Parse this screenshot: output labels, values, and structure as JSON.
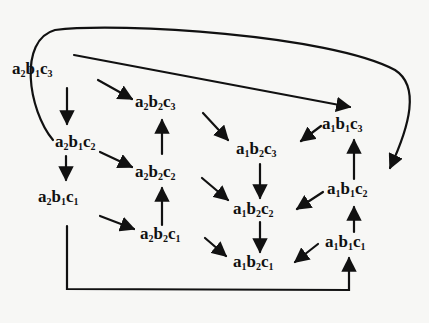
{
  "diagram": {
    "type": "directed-graph",
    "colors": {
      "background": "#f7f7f5",
      "ink": "#111111"
    },
    "nodes": [
      {
        "id": "a2b1c3",
        "parts": [
          [
            "a",
            "2"
          ],
          [
            "b",
            "1"
          ],
          [
            "c",
            "3"
          ]
        ],
        "x": 12,
        "y": 60
      },
      {
        "id": "a2b2c3",
        "parts": [
          [
            "a",
            "2"
          ],
          [
            "b",
            "2"
          ],
          [
            "c",
            "3"
          ]
        ],
        "x": 135,
        "y": 93
      },
      {
        "id": "a2b1c2",
        "parts": [
          [
            "a",
            "2"
          ],
          [
            "b",
            "1"
          ],
          [
            "c",
            "2"
          ]
        ],
        "x": 55,
        "y": 133
      },
      {
        "id": "a2b2c2",
        "parts": [
          [
            "a",
            "2"
          ],
          [
            "b",
            "2"
          ],
          [
            "c",
            "2"
          ]
        ],
        "x": 135,
        "y": 163
      },
      {
        "id": "a2b1c1",
        "parts": [
          [
            "a",
            "2"
          ],
          [
            "b",
            "1"
          ],
          [
            "c",
            "1"
          ]
        ],
        "x": 38,
        "y": 188
      },
      {
        "id": "a2b2c1",
        "parts": [
          [
            "a",
            "2"
          ],
          [
            "b",
            "2"
          ],
          [
            "c",
            "1"
          ]
        ],
        "x": 140,
        "y": 225
      },
      {
        "id": "a1b2c3",
        "parts": [
          [
            "a",
            "1"
          ],
          [
            "b",
            "2"
          ],
          [
            "c",
            "3"
          ]
        ],
        "x": 236,
        "y": 140
      },
      {
        "id": "a1b1c3",
        "parts": [
          [
            "a",
            "1"
          ],
          [
            "b",
            "1"
          ],
          [
            "c",
            "3"
          ]
        ],
        "x": 322,
        "y": 115
      },
      {
        "id": "a1b2c2",
        "parts": [
          [
            "a",
            "1"
          ],
          [
            "b",
            "2"
          ],
          [
            "c",
            "2"
          ]
        ],
        "x": 233,
        "y": 200
      },
      {
        "id": "a1b1c2",
        "parts": [
          [
            "a",
            "1"
          ],
          [
            "b",
            "1"
          ],
          [
            "c",
            "2"
          ]
        ],
        "x": 327,
        "y": 180
      },
      {
        "id": "a1b2c1",
        "parts": [
          [
            "a",
            "1"
          ],
          [
            "b",
            "2"
          ],
          [
            "c",
            "1"
          ]
        ],
        "x": 233,
        "y": 253
      },
      {
        "id": "a1b1c1",
        "parts": [
          [
            "a",
            "1"
          ],
          [
            "b",
            "1"
          ],
          [
            "c",
            "1"
          ]
        ],
        "x": 325,
        "y": 233
      }
    ],
    "edges": [
      {
        "from": "a2b1c3",
        "to": "a2b1c2"
      },
      {
        "from": "a2b1c3",
        "to": "a2b2c3"
      },
      {
        "from": "a2b1c3",
        "to": "a1b1c3"
      },
      {
        "from": "a2b1c2",
        "to": "a2b1c1"
      },
      {
        "from": "a2b1c2",
        "to": "a2b2c2"
      },
      {
        "from": "a2b1c2",
        "to": "a1b1c2",
        "routing": "loop-over-top"
      },
      {
        "from": "a2b1c1",
        "to": "a2b2c1"
      },
      {
        "from": "a2b1c1",
        "to": "a1b1c1",
        "routing": "bracket-under-bottom"
      },
      {
        "from": "a2b2c2",
        "to": "a2b2c3"
      },
      {
        "from": "a2b2c1",
        "to": "a2b2c2"
      },
      {
        "from": "a2b2c3",
        "to": "a1b2c3"
      },
      {
        "from": "a2b2c2",
        "to": "a1b2c2"
      },
      {
        "from": "a2b2c1",
        "to": "a1b2c1"
      },
      {
        "from": "a1b1c3",
        "to": "a1b2c3"
      },
      {
        "from": "a1b1c2",
        "to": "a1b2c2"
      },
      {
        "from": "a1b1c1",
        "to": "a1b2c1"
      },
      {
        "from": "a1b2c3",
        "to": "a1b2c2"
      },
      {
        "from": "a1b2c2",
        "to": "a1b2c1"
      },
      {
        "from": "a1b1c2",
        "to": "a1b1c3"
      },
      {
        "from": "a1b1c1",
        "to": "a1b1c2"
      }
    ]
  }
}
